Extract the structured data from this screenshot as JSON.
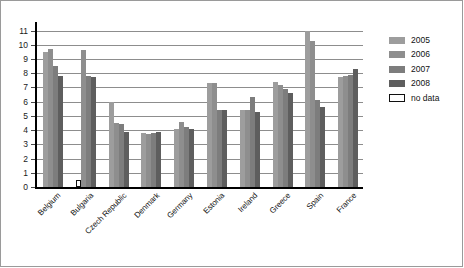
{
  "chart_data": {
    "type": "bar",
    "title": "",
    "xlabel": "",
    "ylabel": "",
    "ylim": [
      0,
      11.6
    ],
    "yticks": [
      0,
      1,
      2,
      3,
      4,
      5,
      6,
      7,
      8,
      9,
      10,
      11
    ],
    "grid": true,
    "legend_position": "right",
    "categories": [
      "Belgium",
      "Bulgaria",
      "Czech Republic",
      "Denmark",
      "Germany",
      "Estonia",
      "Ireland",
      "Greece",
      "Spain",
      "France"
    ],
    "series": [
      {
        "name": "2005",
        "color": "#9d9d9d",
        "values": [
          9.5,
          null,
          6.0,
          3.8,
          4.1,
          7.3,
          5.4,
          7.4,
          11.0,
          7.7
        ]
      },
      {
        "name": "2006",
        "color": "#8e8e8e",
        "values": [
          9.7,
          9.6,
          4.5,
          3.7,
          4.6,
          7.3,
          5.4,
          7.2,
          10.3,
          7.8
        ]
      },
      {
        "name": "2007",
        "color": "#7d7d7d",
        "values": [
          8.5,
          7.8,
          4.4,
          3.8,
          4.2,
          5.4,
          6.3,
          6.9,
          6.1,
          7.9
        ]
      },
      {
        "name": "2008",
        "color": "#5e5e5e",
        "values": [
          7.8,
          7.7,
          3.85,
          3.85,
          4.1,
          5.4,
          5.3,
          6.6,
          5.6,
          8.3
        ]
      }
    ],
    "annotations": [
      {
        "category": "Bulgaria",
        "series": "2005",
        "label": "no data",
        "marker": "hollow-square"
      }
    ]
  },
  "legend": {
    "items": [
      {
        "label": "2005",
        "swatch": "s0"
      },
      {
        "label": "2006",
        "swatch": "s1"
      },
      {
        "label": "2007",
        "swatch": "s2"
      },
      {
        "label": "2008",
        "swatch": "s3"
      },
      {
        "label": "no data",
        "swatch": "nodata"
      }
    ]
  }
}
